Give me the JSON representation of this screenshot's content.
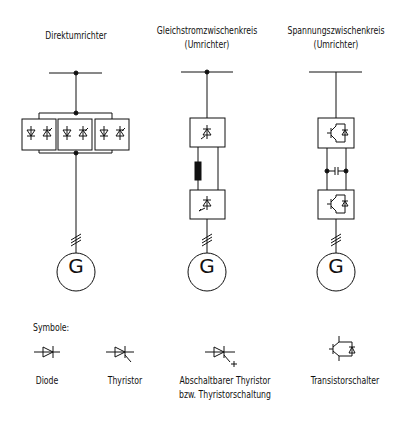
{
  "columns": [
    {
      "title_line1": "Direktumrichter",
      "title_line2": "",
      "generator": "G"
    },
    {
      "title_line1": "Gleichstromzwischenkreis",
      "title_line2": "(Umrichter)",
      "generator": "G"
    },
    {
      "title_line1": "Spannungszwischenkreis",
      "title_line2": "(Umrichter)",
      "generator": "G"
    }
  ],
  "legend": {
    "heading": "Symbole:",
    "items": [
      {
        "symbol": "diode-icon",
        "label_line1": "Diode",
        "label_line2": ""
      },
      {
        "symbol": "thyristor-icon",
        "label_line1": "Thyristor",
        "label_line2": ""
      },
      {
        "symbol": "gto-thyristor-icon",
        "label_line1": "Abschaltbarer Thyristor",
        "label_line2": "bzw. Thyristorschaltung"
      },
      {
        "symbol": "transistor-switch-icon",
        "label_line1": "Transistorschalter",
        "label_line2": ""
      }
    ]
  },
  "colors": {
    "line": "#111111",
    "background": "#ffffff"
  }
}
